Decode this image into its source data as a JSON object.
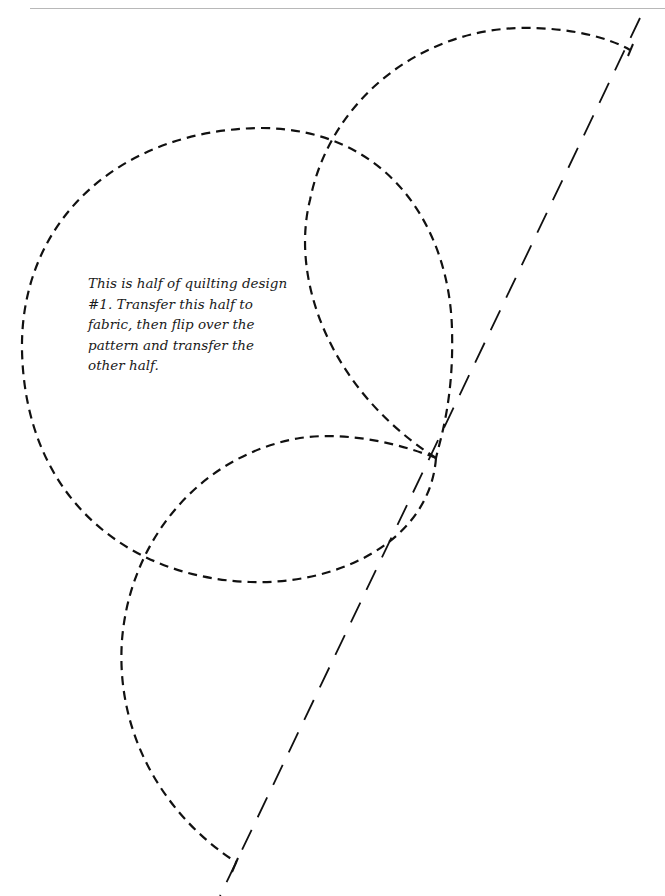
{
  "instructions": {
    "lines": [
      "This is half of quilting design",
      "#1. Transfer this half to",
      "fabric, then flip over the",
      "pattern and transfer the",
      "other half."
    ]
  },
  "diagram": {
    "shapes": [
      "large-circle",
      "upper-right-arc",
      "lower-left-arc",
      "fold-line"
    ],
    "stroke_color": "#111111"
  }
}
